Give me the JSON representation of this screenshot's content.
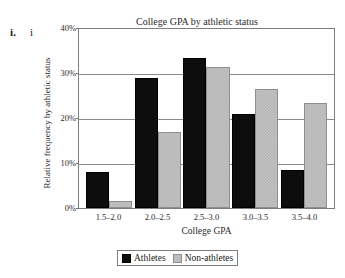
{
  "outline": {
    "marker_a": "i.",
    "marker_b": "i"
  },
  "chart_data": {
    "type": "bar",
    "title": "College GPA by athletic status",
    "xlabel": "College GPA",
    "ylabel": "Relative frequency by athletic status",
    "categories": [
      "1.5–2.0",
      "2.0–2.5",
      "2.5–3.0",
      "3.0–3.5",
      "3.5–4.0"
    ],
    "series": [
      {
        "name": "Athletes",
        "color": "#0d0d0d",
        "values": [
          8,
          29,
          33.5,
          21,
          8.5
        ]
      },
      {
        "name": "Non-athletes",
        "color": "#c2c2c2",
        "values": [
          1.5,
          17,
          31.5,
          26.5,
          23.5
        ]
      }
    ],
    "ylim": [
      0,
      40
    ],
    "yticks": [
      "40%",
      "30%",
      "20%",
      "10%",
      "0%"
    ],
    "ytick_values": [
      40,
      30,
      20,
      10,
      0
    ],
    "grid": true,
    "legend_position": "bottom-center"
  }
}
